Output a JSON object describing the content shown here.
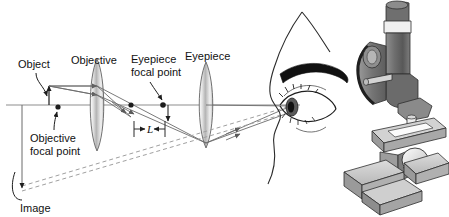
{
  "figure": {
    "background_color": "#ffffff"
  },
  "labels": {
    "object": "Object",
    "objective": "Objective",
    "objective_focal_point_line1": "Objective",
    "objective_focal_point_line2": "focal point",
    "eyepiece_focal_point_line1": "Eyepiece",
    "eyepiece_focal_point_line2": "focal point",
    "eyepiece": "Eyepiece",
    "tube_length": "L",
    "image": "Image"
  },
  "icons": {
    "eye": "eye-icon",
    "microscope": "microscope-icon",
    "objective_lens": "convex-lens-icon",
    "eyepiece_lens": "convex-lens-icon",
    "focal_point_dot": "focal-point-dot-icon",
    "ray_arrow": "ray-arrow-icon",
    "dimension_arrow": "dimension-arrow-icon",
    "leader_line": "leader-line-icon"
  },
  "colors": {
    "axis": "#8a8a8a",
    "ray": "#6b6b6b",
    "dashed_virtual_ray": "#9a9a9a",
    "text": "#111111",
    "lens_fill_light": "#ffffff",
    "lens_fill_mid": "#c9c9c9",
    "lens_fill_dark": "#8f8f8f",
    "lens_outline": "#5a5a5a",
    "eyebrow": "#111111",
    "skin_outline": "#2a2a2a",
    "iris": "#4a4a4a",
    "pupil": "#111111",
    "scope_light": "#d6d6d6",
    "scope_mid": "#a8a8a8",
    "scope_dark": "#767676",
    "scope_darker": "#555555",
    "scope_outline": "#2f2f2f",
    "slide_white": "#fbfbfb",
    "mirror": "#e8e8e8"
  },
  "geometry": {
    "optical_axis_y": 105,
    "objective_lens_x": 97,
    "eyepiece_lens_x": 206,
    "object_x": 49,
    "objective_focal_point_x": 58,
    "eyepiece_focal_point_x": 163,
    "intermediate_image_x": 131,
    "tube_length_start_x": 134,
    "tube_length_end_x": 165,
    "eye_pupil_x": 291,
    "image_arrow_x": 22
  },
  "optics": {
    "description": "Rays from an object just outside the objective focal point form a real intermediate image inside the eyepiece focal point; the eyepiece forms an enlarged virtual image seen by the eye.",
    "tube_length_symbol": "L"
  }
}
